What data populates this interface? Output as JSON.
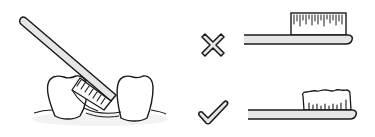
{
  "illustration": {
    "subject": "toothbrush-technique",
    "left_panel": {
      "label": "brushing at gum line",
      "elements": [
        "toothbrush-angled",
        "left-tooth",
        "right-tooth",
        "gum-line"
      ]
    },
    "comparison": [
      {
        "mark": "cross",
        "meaning": "wrong",
        "brush_state": "straight dense bristles"
      },
      {
        "mark": "check",
        "meaning": "right",
        "brush_state": "soft frayed-top bristles"
      }
    ]
  },
  "colors": {
    "stroke": "#1a1a1a",
    "fill_light": "#e6e6e6",
    "background": "#ffffff",
    "gum_shadow": "#f0f0f0"
  }
}
